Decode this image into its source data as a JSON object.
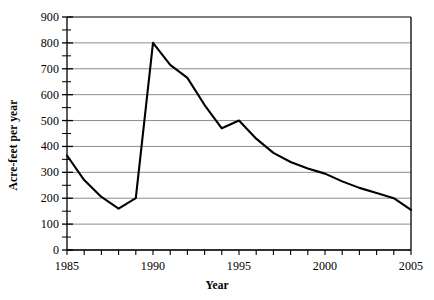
{
  "chart_data": {
    "type": "line",
    "title": "",
    "xlabel": "Year",
    "ylabel": "Acre-feet per year",
    "xlim": [
      1985,
      2005
    ],
    "ylim": [
      0,
      900
    ],
    "ytick_step": 100,
    "yminor_step": 50,
    "xtick_step": 1,
    "grid": "horizontal",
    "legend": "none",
    "x_tick_labels": [
      "1985",
      "1990",
      "1995",
      "2000",
      "2005"
    ],
    "x_tick_label_values": [
      1985,
      1990,
      1995,
      2000,
      2005
    ],
    "y_tick_labels": [
      "0",
      "100",
      "200",
      "300",
      "400",
      "500",
      "600",
      "700",
      "800",
      "900"
    ],
    "y_tick_label_values": [
      0,
      100,
      200,
      300,
      400,
      500,
      600,
      700,
      800,
      900
    ],
    "x": [
      1985,
      1986,
      1987,
      1988,
      1989,
      1990,
      1991,
      1992,
      1993,
      1994,
      1995,
      1996,
      1997,
      1998,
      1999,
      2000,
      2001,
      2002,
      2003,
      2004,
      2005
    ],
    "values": [
      365,
      270,
      205,
      160,
      200,
      800,
      715,
      665,
      560,
      470,
      500,
      430,
      375,
      340,
      315,
      295,
      265,
      240,
      220,
      200,
      155
    ],
    "series": [
      {
        "name": "Acre-feet per year",
        "color": "#000000",
        "values": [
          365,
          270,
          205,
          160,
          200,
          800,
          715,
          665,
          560,
          470,
          500,
          430,
          375,
          340,
          315,
          295,
          265,
          240,
          220,
          200,
          155
        ]
      }
    ]
  },
  "style": {
    "grid_color": "#808080",
    "axis_color": "#000000",
    "line_color": "#000000",
    "background": "#ffffff"
  }
}
